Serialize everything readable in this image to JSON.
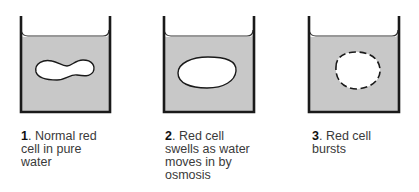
{
  "colors": {
    "liquid": "#c8c8c8",
    "outline": "#1a1a1a",
    "cell_fill": "#ffffff",
    "text": "#3a3a3a"
  },
  "panels": [
    {
      "number": "1",
      "text_line1": ". Normal red",
      "text_line2": "cell in pure",
      "text_line3": "water",
      "cell_state": "normal-biconcave"
    },
    {
      "number": "2",
      "text_line1": ". Red cell",
      "text_line2": "swells as water",
      "text_line3": "moves in by",
      "text_line4": "osmosis",
      "cell_state": "swollen"
    },
    {
      "number": "3",
      "text_line1": ". Red cell",
      "text_line2": "bursts",
      "cell_state": "burst"
    }
  ]
}
